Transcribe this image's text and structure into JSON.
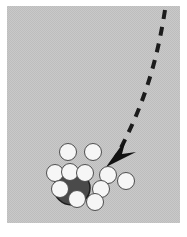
{
  "figure": {
    "type": "schematic-diagram",
    "width": 187,
    "height": 237,
    "background_color": "#ffffff",
    "panel": {
      "name": "gray-panel",
      "x": 7,
      "y": 6,
      "width": 173,
      "height": 217,
      "fill_color": "#c6c6c6",
      "texture": "dithered-halftone",
      "border": "none"
    },
    "dark_blob": {
      "name": "dark-aggregate",
      "cx": 72,
      "cy": 188,
      "rx": 18,
      "ry": 17,
      "fill_color": "#4a4a4a",
      "stroke_color": "#1c1c1c",
      "stroke_width": 1.5
    },
    "circles": [
      {
        "id": "c1",
        "cx": 68,
        "cy": 152,
        "r": 8.5,
        "fill": "#f6f6f6",
        "stroke": "#4d4d4d"
      },
      {
        "id": "c2",
        "cx": 93,
        "cy": 152,
        "r": 8.5,
        "fill": "#f6f6f6",
        "stroke": "#4d4d4d"
      },
      {
        "id": "c3",
        "cx": 55,
        "cy": 173,
        "r": 8.5,
        "fill": "#f6f6f6",
        "stroke": "#4d4d4d"
      },
      {
        "id": "c4",
        "cx": 70,
        "cy": 172,
        "r": 8.5,
        "fill": "#f6f6f6",
        "stroke": "#4d4d4d"
      },
      {
        "id": "c5",
        "cx": 85,
        "cy": 173,
        "r": 8.5,
        "fill": "#f6f6f6",
        "stroke": "#4d4d4d"
      },
      {
        "id": "c6",
        "cx": 108,
        "cy": 175,
        "r": 8.5,
        "fill": "#f6f6f6",
        "stroke": "#4d4d4d"
      },
      {
        "id": "c7",
        "cx": 126,
        "cy": 181,
        "r": 8.5,
        "fill": "#f6f6f6",
        "stroke": "#4d4d4d"
      },
      {
        "id": "c8",
        "cx": 60,
        "cy": 189,
        "r": 8.5,
        "fill": "#f6f6f6",
        "stroke": "#4d4d4d"
      },
      {
        "id": "c9",
        "cx": 101,
        "cy": 189,
        "r": 8.5,
        "fill": "#f6f6f6",
        "stroke": "#4d4d4d"
      },
      {
        "id": "c10",
        "cx": 77,
        "cy": 199,
        "r": 8.5,
        "fill": "#f6f6f6",
        "stroke": "#4d4d4d"
      },
      {
        "id": "c11",
        "cx": 95,
        "cy": 202,
        "r": 8.5,
        "fill": "#f6f6f6",
        "stroke": "#4d4d4d"
      }
    ],
    "trajectory": {
      "name": "dashed-trajectory",
      "path": "M 165 10 C 157 62, 143 108, 116 157",
      "stroke_color": "#1c1c1c",
      "stroke_width": 4,
      "dash_pattern": "9 8",
      "linecap": "butt"
    },
    "arrowhead": {
      "name": "barbed-arrowhead",
      "points": "106,167 126,139 122,154 136,152",
      "fill_color": "#111111",
      "direction": "down-left",
      "tip_x": 106,
      "tip_y": 167
    }
  }
}
